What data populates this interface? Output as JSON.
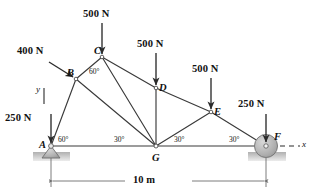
{
  "diagram": {
    "span_label": "10 m",
    "axis": {
      "x_label": "x",
      "y_label": "y"
    },
    "colors": {
      "member": "#3a3a3a",
      "load_arrow": "#2b2b2b",
      "support_fill": "#b7b7b7",
      "ground_fill": "#c9c9c9",
      "dimension": "#6e6e6e",
      "text": "#111111"
    },
    "nodes": [
      {
        "id": "A",
        "label": "A",
        "x": 51,
        "y": 146
      },
      {
        "id": "B",
        "label": "B",
        "x": 76,
        "y": 79
      },
      {
        "id": "C",
        "label": "C",
        "x": 102,
        "y": 57
      },
      {
        "id": "D",
        "label": "D",
        "x": 156,
        "y": 88
      },
      {
        "id": "E",
        "label": "E",
        "x": 211,
        "y": 112
      },
      {
        "id": "F",
        "label": "F",
        "x": 266,
        "y": 146
      },
      {
        "id": "G",
        "label": "G",
        "x": 156,
        "y": 146
      }
    ],
    "members": [
      {
        "from": "A",
        "to": "B"
      },
      {
        "from": "B",
        "to": "C"
      },
      {
        "from": "C",
        "to": "D"
      },
      {
        "from": "D",
        "to": "E"
      },
      {
        "from": "E",
        "to": "F"
      },
      {
        "from": "A",
        "to": "G"
      },
      {
        "from": "G",
        "to": "F"
      },
      {
        "from": "B",
        "to": "G"
      },
      {
        "from": "C",
        "to": "G"
      },
      {
        "from": "D",
        "to": "G"
      },
      {
        "from": "E",
        "to": "G"
      }
    ],
    "loads": [
      {
        "id": "load-c",
        "label": "500 N",
        "at": "C",
        "direction": "down"
      },
      {
        "id": "load-d",
        "label": "500 N",
        "at": "D",
        "direction": "down"
      },
      {
        "id": "load-e",
        "label": "500 N",
        "at": "E",
        "direction": "down"
      },
      {
        "id": "load-b",
        "label": "400 N",
        "at": "B",
        "direction": "diagonal-down-right"
      },
      {
        "id": "load-a",
        "label": "250 N",
        "at": "A",
        "direction": "down"
      },
      {
        "id": "load-f",
        "label": "250 N",
        "at": "F",
        "direction": "down"
      }
    ],
    "angles": [
      {
        "id": "angle-c",
        "label": "60°",
        "at": "C"
      },
      {
        "id": "angle-a",
        "label": "60°",
        "at": "A"
      },
      {
        "id": "angle-g1",
        "label": "30°",
        "at": "G"
      },
      {
        "id": "angle-g2",
        "label": "30°",
        "at": "G"
      },
      {
        "id": "angle-f",
        "label": "30°",
        "at": "F"
      }
    ],
    "supports": [
      {
        "id": "support-a",
        "type": "pin",
        "at": "A"
      },
      {
        "id": "support-f",
        "type": "roller",
        "at": "F"
      }
    ]
  }
}
